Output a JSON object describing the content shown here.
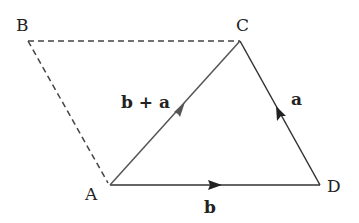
{
  "diagram": {
    "type": "vector-parallelogram",
    "points": {
      "A": {
        "label": "A",
        "x": 110,
        "y": 185
      },
      "B": {
        "label": "B",
        "x": 28,
        "y": 41
      },
      "C": {
        "label": "C",
        "x": 240,
        "y": 41
      },
      "D": {
        "label": "D",
        "x": 320,
        "y": 185
      }
    },
    "vectors": [
      {
        "from": "A",
        "to": "D",
        "label": "b",
        "style": "solid"
      },
      {
        "from": "D",
        "to": "C",
        "label": "a",
        "style": "solid"
      },
      {
        "from": "A",
        "to": "C",
        "label": "b + a",
        "style": "solid"
      }
    ],
    "dashed_edges": [
      {
        "from": "B",
        "to": "C"
      },
      {
        "from": "A",
        "to": "B"
      }
    ],
    "colors": {
      "line": "#333333",
      "dash": "#444444",
      "text": "#222222"
    }
  },
  "labels": {
    "A": "A",
    "B": "B",
    "C": "C",
    "D": "D",
    "vec_b": "b",
    "vec_a": "a",
    "vec_b_plus_a": "b + a"
  }
}
